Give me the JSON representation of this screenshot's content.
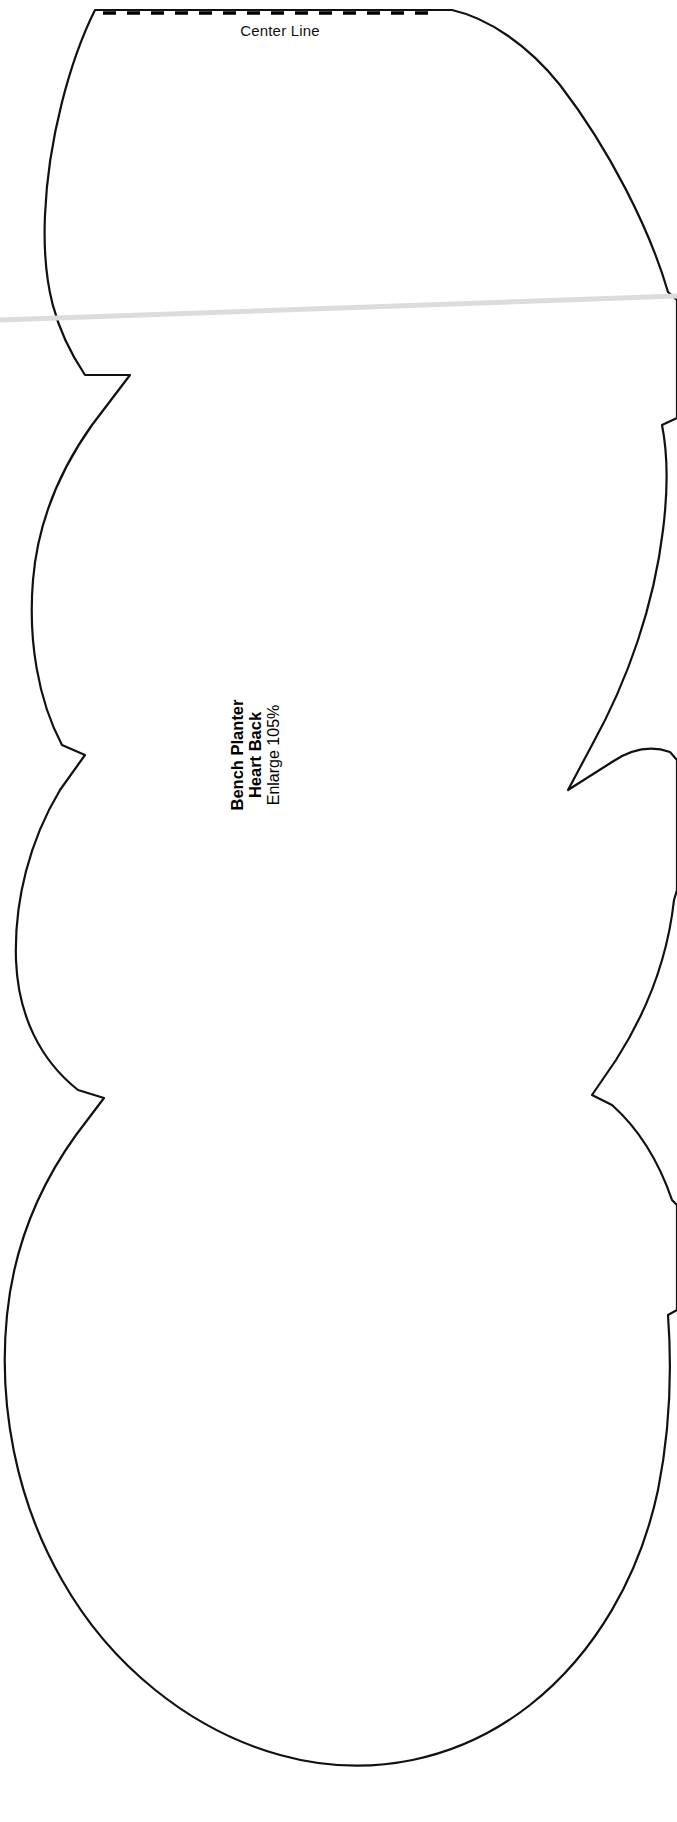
{
  "page": {
    "background_color": "#ffffff",
    "width": 677,
    "height": 1822,
    "document_type": "sewing-pattern-template"
  },
  "center_line": {
    "label": "Center Line",
    "style": "dashed",
    "color": "#000000"
  },
  "caption": {
    "line1": "Bench Planter",
    "line2": "Heart Back",
    "line3": "Enlarge 105%",
    "rotation_degrees": -90,
    "color": "#000000"
  },
  "outline": {
    "stroke_color": "#111111",
    "fill_color": "#ffffff",
    "stroke_width": 2.2
  },
  "scan_artifact": {
    "name": "fold-line",
    "color": "#dcdcdc",
    "description": "faint horizontal gray scan fold line"
  }
}
